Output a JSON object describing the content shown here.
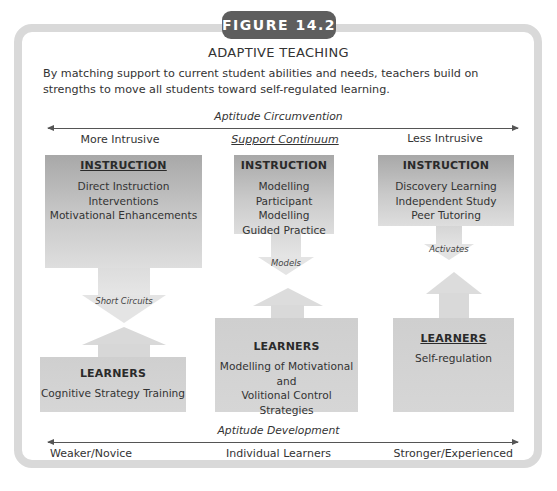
{
  "figure": {
    "badge": "FIGURE 14.2",
    "title": "ADAPTIVE TEACHING",
    "intro": "By matching support to current student abilities and needs, teachers build on strengths to move all students toward self-regulated learning."
  },
  "top_axis": {
    "label": "Aptitude Circumvention",
    "left": "More Intrusive",
    "center": "Support Continuum",
    "right": "Less Intrusive"
  },
  "columns": [
    {
      "instruction": {
        "heading": "INSTRUCTION",
        "items": [
          "Direct Instruction",
          "Interventions",
          "Motivational Enhancements"
        ]
      },
      "connector": "Short Circuits",
      "learners": {
        "heading": "LEARNERS",
        "items": [
          "Cognitive Strategy Training"
        ]
      }
    },
    {
      "instruction": {
        "heading": "INSTRUCTION",
        "items": [
          "Modelling",
          "Participant Modelling",
          "Guided Practice"
        ]
      },
      "connector": "Models",
      "learners": {
        "heading": "LEARNERS",
        "items": [
          "Modelling of Motivational and",
          "Volitional Control Strategies"
        ]
      }
    },
    {
      "instruction": {
        "heading": "INSTRUCTION",
        "items": [
          "Discovery Learning",
          "Independent Study",
          "Peer Tutoring"
        ]
      },
      "connector": "Activates",
      "learners": {
        "heading": "LEARNERS",
        "items": [
          "Self-regulation"
        ]
      }
    }
  ],
  "bottom_axis": {
    "label": "Aptitude Development",
    "left": "Weaker/Novice",
    "center": "Individual Learners",
    "right": "Stronger/Experienced"
  },
  "colors": {
    "badge": "#5e5e5e",
    "frame": "#d9d9d9",
    "instruction_box": "#b5b5b5",
    "learners_box": "#d3d3d3"
  }
}
